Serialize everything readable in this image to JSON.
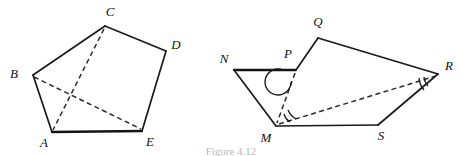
{
  "figure": {
    "caption": "Figure 4.12",
    "background_color": "#ffffff",
    "stroke_color": "#1a1a1a",
    "dash_color": "#2a2a2a",
    "label_color": "#111111",
    "canvas": {
      "width": 462,
      "height": 156
    }
  },
  "left_figure": {
    "name": "pentagon-abcde",
    "vertices": [
      {
        "id": "A",
        "label": "A",
        "x": 52,
        "y": 132,
        "label_x": 44,
        "label_y": 147
      },
      {
        "id": "B",
        "label": "B",
        "x": 33,
        "y": 75,
        "label_x": 14,
        "label_y": 78
      },
      {
        "id": "C",
        "label": "C",
        "x": 105,
        "y": 26,
        "label_x": 110,
        "label_y": 16
      },
      {
        "id": "D",
        "label": "D",
        "x": 166,
        "y": 51,
        "label_x": 176,
        "label_y": 49
      },
      {
        "id": "E",
        "label": "E",
        "x": 142,
        "y": 131,
        "label_x": 150,
        "label_y": 146
      }
    ],
    "edges": [
      {
        "from": "A",
        "to": "B",
        "style": "solid"
      },
      {
        "from": "B",
        "to": "C",
        "style": "solid"
      },
      {
        "from": "C",
        "to": "D",
        "style": "solid"
      },
      {
        "from": "D",
        "to": "E",
        "style": "solid"
      },
      {
        "from": "E",
        "to": "A",
        "style": "solid-thick"
      }
    ],
    "diagonals": [
      {
        "from": "B",
        "to": "E",
        "style": "dashed"
      },
      {
        "from": "C",
        "to": "A",
        "style": "dashed"
      }
    ],
    "angle_arcs": []
  },
  "right_figure": {
    "name": "pentagon-npqrsm",
    "vertices": [
      {
        "id": "N",
        "label": "N",
        "x": 234,
        "y": 70,
        "label_x": 224,
        "label_y": 63
      },
      {
        "id": "P",
        "label": "P",
        "x": 296,
        "y": 70,
        "label_x": 288,
        "label_y": 58
      },
      {
        "id": "Q",
        "label": "Q",
        "x": 318,
        "y": 38,
        "label_x": 318,
        "label_y": 26
      },
      {
        "id": "R",
        "label": "R",
        "x": 438,
        "y": 74,
        "label_x": 447,
        "label_y": 70
      },
      {
        "id": "S",
        "label": "S",
        "x": 378,
        "y": 125,
        "label_x": 381,
        "label_y": 140
      },
      {
        "id": "M",
        "label": "M",
        "x": 276,
        "y": 126,
        "label_x": 266,
        "label_y": 142
      }
    ],
    "edges": [
      {
        "from": "N",
        "to": "P",
        "style": "solid-thick"
      },
      {
        "from": "P",
        "to": "Q",
        "style": "solid"
      },
      {
        "from": "Q",
        "to": "R",
        "style": "solid"
      },
      {
        "from": "R",
        "to": "S",
        "style": "solid"
      },
      {
        "from": "S",
        "to": "M",
        "style": "solid"
      },
      {
        "from": "M",
        "to": "N",
        "style": "solid"
      }
    ],
    "diagonals": [
      {
        "from": "P",
        "to": "M",
        "style": "dashed"
      },
      {
        "from": "M",
        "to": "R",
        "style": "dashed"
      }
    ],
    "angle_arcs": [
      {
        "at": "P",
        "type": "reflex-single-arc",
        "marks": 1
      },
      {
        "at": "M",
        "type": "double-arc",
        "marks": 2
      },
      {
        "at": "R",
        "type": "double-arc",
        "marks": 2
      }
    ]
  }
}
